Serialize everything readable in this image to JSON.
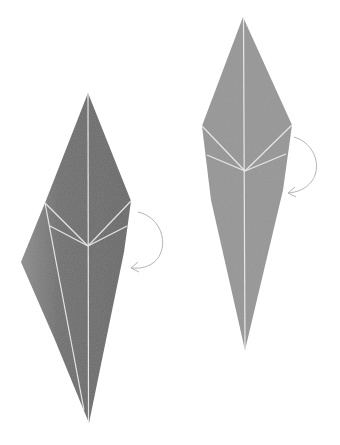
{
  "diagram": {
    "type": "origami-folding-steps",
    "colors": {
      "background": "#ffffff",
      "left_paper": "#6b6b6b",
      "left_paper_light": "#8a8a8a",
      "right_paper": "#949494",
      "crease": "#e8e8e8",
      "arrow": "#b4b4b4"
    },
    "steps": [
      {
        "id": "step-left",
        "shape": "kite-with-wing",
        "polygon": [
          [
            88,
            93
          ],
          [
            131,
            201
          ],
          [
            124,
            252
          ],
          [
            89,
            423
          ],
          [
            55,
            340
          ],
          [
            21,
            262
          ],
          [
            45,
            203
          ]
        ],
        "creases": [
          [
            [
              88,
              93
            ],
            [
              88,
              423
            ]
          ],
          [
            [
              45,
              203
            ],
            [
              88,
              246
            ]
          ],
          [
            [
              131,
              201
            ],
            [
              88,
              246
            ]
          ],
          [
            [
              50,
              226
            ],
            [
              88,
              246
            ]
          ],
          [
            [
              127,
              226
            ],
            [
              88,
              246
            ]
          ],
          [
            [
              45,
              203
            ],
            [
              84,
              410
            ]
          ]
        ],
        "arrow": {
          "path": "M138,212 C172,220 172,272 130,268",
          "head_at": [
            130,
            268
          ]
        }
      },
      {
        "id": "step-right",
        "shape": "kite",
        "polygon": [
          [
            243,
            17
          ],
          [
            292,
            125
          ],
          [
            282,
            190
          ],
          [
            245,
            350
          ],
          [
            211,
            200
          ],
          [
            202,
            126
          ]
        ],
        "creases": [
          [
            [
              244,
              17
            ],
            [
              245,
              350
            ]
          ],
          [
            [
              202,
              126
            ],
            [
              245,
              171
            ]
          ],
          [
            [
              292,
              125
            ],
            [
              245,
              171
            ]
          ],
          [
            [
              207,
              155
            ],
            [
              245,
              171
            ]
          ],
          [
            [
              286,
              154
            ],
            [
              245,
              171
            ]
          ]
        ],
        "arrow": {
          "path": "M294,137 C324,146 326,190 287,193",
          "head_at": [
            287,
            193
          ]
        }
      }
    ]
  }
}
